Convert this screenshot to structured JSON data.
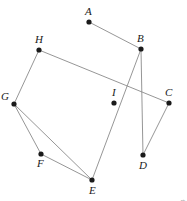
{
  "figure": {
    "width": 187,
    "height": 201,
    "background_color": "#ffffff",
    "line_color": "#8a8a8a",
    "point_color": "#1a1a1a",
    "credit_color": "#b3b3b3",
    "credit": "© Cengage Learning 2014"
  },
  "chart_data": {
    "type": "scatter",
    "title": "",
    "xlabel": "",
    "ylabel": "",
    "grid": false,
    "legend": "none",
    "xlim": [
      0,
      187
    ],
    "ylim": [
      201,
      0
    ],
    "points": [
      {
        "id": "A",
        "label": "A",
        "x": 89,
        "y": 22,
        "label_dx": -4,
        "label_dy": -7
      },
      {
        "id": "B",
        "label": "B",
        "x": 141,
        "y": 49,
        "label_dx": -4,
        "label_dy": -7
      },
      {
        "id": "H",
        "label": "H",
        "x": 39,
        "y": 50,
        "label_dx": -4,
        "label_dy": -7
      },
      {
        "id": "G",
        "label": "G",
        "x": 14,
        "y": 104,
        "label_dx": -13,
        "label_dy": -4
      },
      {
        "id": "I",
        "label": "I",
        "x": 114,
        "y": 103,
        "label_dx": -2,
        "label_dy": -7
      },
      {
        "id": "C",
        "label": "C",
        "x": 169,
        "y": 103,
        "label_dx": -4,
        "label_dy": -7
      },
      {
        "id": "F",
        "label": "F",
        "x": 41,
        "y": 154,
        "label_dx": -4,
        "label_dy": 13
      },
      {
        "id": "D",
        "label": "D",
        "x": 143,
        "y": 155,
        "label_dx": -4,
        "label_dy": 14
      },
      {
        "id": "E",
        "label": "E",
        "x": 92,
        "y": 180,
        "label_dx": -3,
        "label_dy": 14
      }
    ],
    "segments": [
      {
        "from": "A",
        "to": "B"
      },
      {
        "from": "H",
        "to": "C"
      },
      {
        "from": "H",
        "to": "G"
      },
      {
        "from": "G",
        "to": "F"
      },
      {
        "from": "G",
        "to": "E"
      },
      {
        "from": "F",
        "to": "E"
      },
      {
        "from": "B",
        "to": "E"
      },
      {
        "from": "B",
        "to": "D"
      },
      {
        "from": "D",
        "to": "C"
      }
    ]
  }
}
